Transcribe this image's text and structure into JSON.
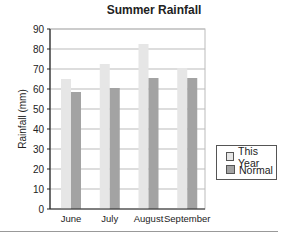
{
  "chart_data": {
    "type": "bar",
    "title": "Summer Rainfall",
    "xlabel": "",
    "ylabel": "Rainfall (mm)",
    "categories": [
      "June",
      "July",
      "August",
      "September"
    ],
    "series": [
      {
        "name": "This Year",
        "values": [
          65,
          72.5,
          82.5,
          70.5
        ],
        "color": "#e6e6e6"
      },
      {
        "name": "Normal",
        "values": [
          58.5,
          60.5,
          65.5,
          65.5
        ],
        "color": "#a3a3a3"
      }
    ],
    "ylim": [
      0,
      90
    ],
    "yticks": [
      0,
      10,
      20,
      30,
      40,
      50,
      60,
      70,
      80,
      90
    ],
    "grid": true,
    "legend_position": "right"
  },
  "legend": {
    "items": [
      {
        "label": "This Year",
        "color": "#e6e6e6"
      },
      {
        "label": "Normal",
        "color": "#a3a3a3"
      }
    ]
  }
}
